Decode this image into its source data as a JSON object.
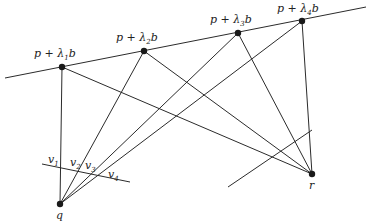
{
  "diagram": {
    "title": "",
    "main_line": {
      "from": [
        5,
        78
      ],
      "to": [
        366,
        7
      ]
    },
    "points": [
      {
        "id": "l1",
        "label": "p + λ1b",
        "prefix": "p + λ",
        "sub": "1",
        "suffix": "b",
        "xy": [
          62,
          67
        ],
        "label_xy": [
          34,
          57
        ]
      },
      {
        "id": "l2",
        "label": "p + λ2b",
        "prefix": "p + λ",
        "sub": "2",
        "suffix": "b",
        "xy": [
          144,
          51
        ],
        "label_xy": [
          116,
          41
        ]
      },
      {
        "id": "l3",
        "label": "p + λ3b",
        "prefix": "p + λ",
        "sub": "3",
        "suffix": "b",
        "xy": [
          238,
          33
        ],
        "label_xy": [
          210,
          23
        ]
      },
      {
        "id": "l4",
        "label": "p + λ4b",
        "prefix": "p + λ",
        "sub": "4",
        "suffix": "b",
        "xy": [
          302,
          21
        ],
        "label_xy": [
          277,
          12
        ]
      }
    ],
    "q": {
      "label": "q",
      "xy": [
        60,
        204
      ],
      "label_xy": [
        56,
        219
      ]
    },
    "r": {
      "label": "r",
      "xy": [
        312,
        174
      ],
      "label_xy": [
        309,
        189
      ]
    },
    "q_plane_line": {
      "from": [
        42,
        164
      ],
      "to": [
        130,
        182
      ]
    },
    "r_plane_line": {
      "from": [
        228,
        187
      ],
      "to": [
        312,
        130
      ]
    },
    "v_labels": [
      {
        "prefix": "v",
        "sub": "1",
        "xy": [
          48,
          163
        ]
      },
      {
        "prefix": "v",
        "sub": "2",
        "xy": [
          70,
          166
        ]
      },
      {
        "prefix": "v",
        "sub": "3",
        "xy": [
          85,
          169
        ]
      },
      {
        "prefix": "v",
        "sub": "4",
        "xy": [
          108,
          178
        ]
      }
    ]
  }
}
